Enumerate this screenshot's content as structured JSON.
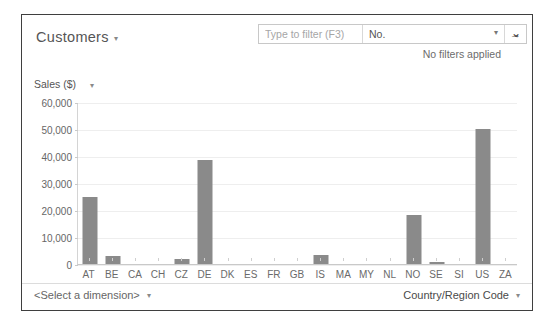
{
  "header": {
    "title": "Customers",
    "title_caret": "▾",
    "expand_chevron": "⌄",
    "filter_status": "No filters applied"
  },
  "filter": {
    "placeholder": "Type to filter (F3)",
    "field_value": "No.",
    "field_caret": "▾",
    "go_icon": "→"
  },
  "axis_title": {
    "label": "Sales ($)",
    "caret": "▾"
  },
  "footer": {
    "dimension_label": "<Select a dimension>",
    "dimension_caret": "▾",
    "measure_label": "Country/Region Code",
    "measure_caret": "▾"
  },
  "chart_data": {
    "type": "bar",
    "title": "",
    "xlabel": "",
    "ylabel": "Sales ($)",
    "ylim": [
      0,
      60000
    ],
    "ytick_labels": [
      "60,000",
      "50,000",
      "40,000",
      "30,000",
      "20,000",
      "10,000",
      "0"
    ],
    "ytick_values": [
      60000,
      50000,
      40000,
      30000,
      20000,
      10000,
      0
    ],
    "grid": true,
    "legend": false,
    "bar_color": "#8a8a8a",
    "categories": [
      "AT",
      "BE",
      "CA",
      "CH",
      "CZ",
      "DE",
      "DK",
      "ES",
      "FR",
      "GB",
      "IS",
      "MA",
      "MY",
      "NL",
      "NO",
      "SE",
      "SI",
      "US",
      "ZA"
    ],
    "values": [
      25000,
      3000,
      0,
      0,
      2000,
      38500,
      0,
      0,
      0,
      0,
      3500,
      0,
      0,
      0,
      18000,
      700,
      0,
      50000,
      0
    ]
  }
}
